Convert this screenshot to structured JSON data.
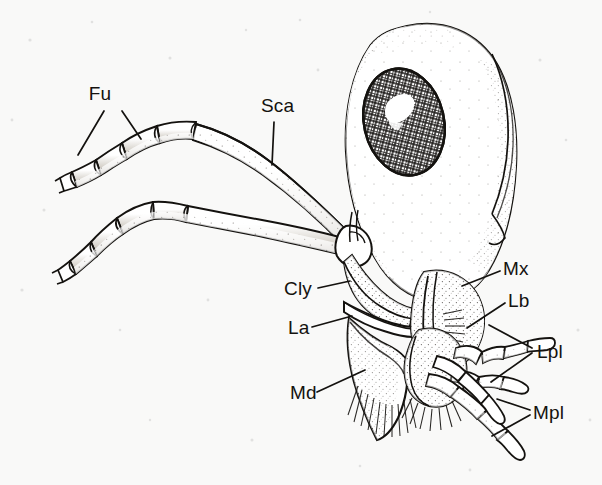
{
  "figure": {
    "style": "stipple-and-line scientific illustration",
    "background_color": "#f9f9f8",
    "ink_color": "#14120f",
    "width": 602,
    "height": 485
  },
  "labels": [
    {
      "id": "fu",
      "text": "Fu",
      "full_name": "funicle",
      "x": 100,
      "y": 100,
      "leaders": 2,
      "points_to": "antennal funicle segments"
    },
    {
      "id": "sca",
      "text": "Sca",
      "full_name": "scape",
      "x": 261,
      "y": 112,
      "leaders": 1,
      "points_to": "antennal scape"
    },
    {
      "id": "cly",
      "text": "Cly",
      "full_name": "clypeus",
      "x": 284,
      "y": 288,
      "leaders": 1,
      "points_to": "clypeus"
    },
    {
      "id": "la",
      "text": "La",
      "full_name": "labrum",
      "x": 288,
      "y": 330,
      "leaders": 1,
      "points_to": "labrum"
    },
    {
      "id": "md",
      "text": "Md",
      "full_name": "mandible",
      "x": 290,
      "y": 396,
      "leaders": 1,
      "points_to": "mandible"
    },
    {
      "id": "mx",
      "text": "Mx",
      "full_name": "maxilla",
      "x": 503,
      "y": 268,
      "leaders": 1,
      "points_to": "maxilla"
    },
    {
      "id": "lb",
      "text": "Lb",
      "full_name": "labium",
      "x": 508,
      "y": 300,
      "leaders": 1,
      "points_to": "labium"
    },
    {
      "id": "lpl",
      "text": "Lpl",
      "full_name": "labial palp",
      "x": 537,
      "y": 350,
      "leaders": 2,
      "points_to": "labial palp segments"
    },
    {
      "id": "mpl",
      "text": "Mpl",
      "full_name": "maxillary palp",
      "x": 533,
      "y": 412,
      "leaders": 2,
      "points_to": "maxillary palp segments"
    }
  ],
  "structures": [
    {
      "id": "head-capsule",
      "name": "head capsule",
      "shading": "stipple"
    },
    {
      "id": "compound-eye",
      "name": "compound eye",
      "shading": "cross-hatch with highlight"
    },
    {
      "id": "antenna-upper",
      "name": "upper antenna",
      "segments": 5
    },
    {
      "id": "antenna-lower",
      "name": "lower antenna",
      "segments": 5
    },
    {
      "id": "clypeus",
      "name": "clypeus",
      "shading": "stipple"
    },
    {
      "id": "labrum",
      "name": "labrum",
      "shading": "line"
    },
    {
      "id": "mandible",
      "name": "mandible",
      "shading": "stipple"
    },
    {
      "id": "maxilla",
      "name": "maxilla",
      "shading": "stipple with setae"
    },
    {
      "id": "labium",
      "name": "labium",
      "shading": "stipple with setae"
    },
    {
      "id": "labial-palp",
      "name": "labial palp",
      "segments": 3
    },
    {
      "id": "maxillary-palp",
      "name": "maxillary palp",
      "segments": 4
    },
    {
      "id": "setal-fringe",
      "name": "setal fringe",
      "shading": "fine hair lines"
    }
  ]
}
